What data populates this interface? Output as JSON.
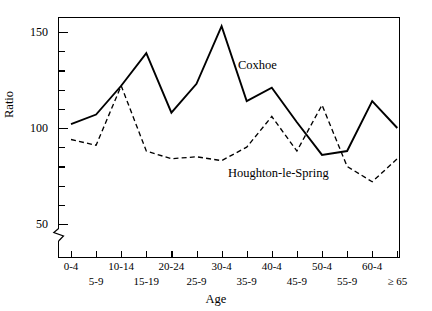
{
  "chart_data": {
    "type": "line",
    "title": "",
    "xlabel": "Age",
    "ylabel": "Ratio",
    "categories": [
      "0-4",
      "5-9",
      "10-14",
      "15-19",
      "20-24",
      "25-9",
      "30-4",
      "35-9",
      "40-4",
      "45-9",
      "50-4",
      "55-9",
      "60-4",
      "≥ 65"
    ],
    "ylim": [
      50,
      160
    ],
    "y_ticks_major": [
      50,
      100,
      150
    ],
    "y_ticks_minor": [
      60,
      70,
      80,
      90,
      110,
      120,
      130,
      140
    ],
    "axis_break": true,
    "grid": false,
    "legend_position": "inline-annotation",
    "series": [
      {
        "name": "Coxhoe",
        "style": "solid",
        "values": [
          102,
          107,
          122,
          139,
          108,
          123,
          153,
          114,
          121,
          103,
          86,
          88,
          114,
          100
        ]
      },
      {
        "name": "Houghton-le-Spring",
        "style": "dashed",
        "values": [
          94,
          91,
          122,
          88,
          84,
          85,
          83,
          90,
          106,
          88,
          112,
          80,
          72,
          84
        ]
      }
    ]
  },
  "axis": {
    "y_title": "Ratio",
    "x_title": "Age",
    "y_tick_labels": [
      "150",
      "100",
      "50"
    ],
    "x_tick_labels_row_a": [
      "0-4",
      "10-14",
      "20-24",
      "30-4",
      "40-4",
      "50-4",
      "60-4"
    ],
    "x_tick_labels_row_b": [
      "5-9",
      "15-19",
      "25-9",
      "35-9",
      "45-9",
      "55-9",
      "≥ 65"
    ]
  },
  "annotations": {
    "coxhoe": "Coxhoe",
    "houghton": "Houghton-le-Spring"
  },
  "colors": {
    "background": "#ffffff",
    "line": "#000000",
    "text": "#000000"
  }
}
